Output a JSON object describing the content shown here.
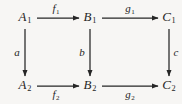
{
  "diagram": {
    "kind": "commutative-diagram",
    "background_color": "#f7f6f4",
    "stroke_color": "#262626",
    "text_color": "#262626",
    "width": 182,
    "height": 104,
    "nodes": [
      {
        "id": "A1",
        "base": "A",
        "sub": "1",
        "x": 25,
        "y": 18,
        "row": "top",
        "col": 0
      },
      {
        "id": "B1",
        "base": "B",
        "sub": "1",
        "x": 90,
        "y": 18,
        "row": "top",
        "col": 1
      },
      {
        "id": "C1",
        "base": "C",
        "sub": "1",
        "x": 169,
        "y": 18,
        "row": "top",
        "col": 2
      },
      {
        "id": "A2",
        "base": "A",
        "sub": "2",
        "x": 25,
        "y": 86,
        "row": "bottom",
        "col": 0
      },
      {
        "id": "B2",
        "base": "B",
        "sub": "2",
        "x": 90,
        "y": 86,
        "row": "bottom",
        "col": 1
      },
      {
        "id": "C2",
        "base": "C",
        "sub": "2",
        "x": 169,
        "y": 86,
        "row": "bottom",
        "col": 2
      }
    ],
    "edges": [
      {
        "id": "f1",
        "base": "f",
        "sub": "1",
        "from": "A1",
        "to": "B1",
        "direction": "right",
        "label_x": 56,
        "label_y": 10,
        "label_side": "above",
        "x1": 37,
        "y1": 18,
        "x2": 79,
        "y2": 18
      },
      {
        "id": "g1",
        "base": "g",
        "sub": "1",
        "from": "B1",
        "to": "C1",
        "direction": "right",
        "label_x": 130,
        "label_y": 10,
        "label_side": "above",
        "x1": 102,
        "y1": 18,
        "x2": 158,
        "y2": 18
      },
      {
        "id": "f2",
        "base": "f",
        "sub": "2",
        "from": "A2",
        "to": "B2",
        "direction": "right",
        "label_x": 56,
        "label_y": 96,
        "label_side": "below",
        "x1": 37,
        "y1": 86,
        "x2": 79,
        "y2": 86
      },
      {
        "id": "g2",
        "base": "g",
        "sub": "2",
        "from": "B2",
        "to": "C2",
        "direction": "right",
        "label_x": 130,
        "label_y": 96,
        "label_side": "below",
        "x1": 102,
        "y1": 86,
        "x2": 158,
        "y2": 86
      },
      {
        "id": "a",
        "base": "a",
        "sub": "",
        "from": "A1",
        "to": "A2",
        "direction": "down",
        "label_x": 17,
        "label_y": 52,
        "label_side": "left",
        "x1": 25,
        "y1": 29,
        "x2": 25,
        "y2": 76
      },
      {
        "id": "b",
        "base": "b",
        "sub": "",
        "from": "B1",
        "to": "B2",
        "direction": "down",
        "label_x": 82,
        "label_y": 52,
        "label_side": "left",
        "x1": 90,
        "y1": 29,
        "x2": 90,
        "y2": 76
      },
      {
        "id": "c",
        "base": "c",
        "sub": "",
        "from": "C1",
        "to": "C2",
        "direction": "down",
        "label_x": 176,
        "label_y": 52,
        "label_side": "right",
        "x1": 169,
        "y1": 29,
        "x2": 169,
        "y2": 76
      }
    ]
  }
}
